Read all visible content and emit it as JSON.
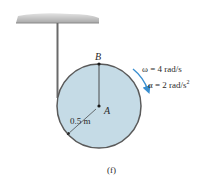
{
  "figure": {
    "caption": "(f)",
    "points": {
      "top": "B",
      "center": "A"
    },
    "radius_label": "0.5 m",
    "omega_label": "ω = 4 rad/s",
    "alpha_label": "α = 2 rad/s",
    "alpha_exponent": "2",
    "colors": {
      "disk_fill": "#c5dbe6",
      "disk_stroke": "#5a5a5a",
      "arrow": "#3a8fd0",
      "ceiling": "#b5b5b5",
      "rope": "#6a6a6a"
    }
  }
}
